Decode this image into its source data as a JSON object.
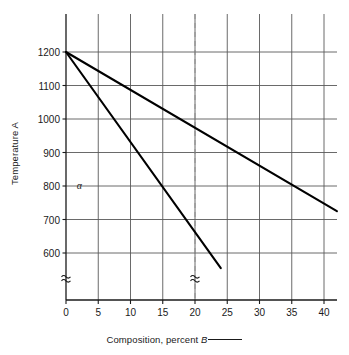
{
  "chart_data": {
    "type": "line",
    "title": "",
    "xlabel": "Composition, percent B",
    "ylabel": "Temperature A",
    "xlim": [
      0,
      42
    ],
    "ylim": [
      450,
      1300
    ],
    "grid": true,
    "legend": "none",
    "x_ticks": [
      "0",
      "5",
      "10",
      "15",
      "20",
      "25",
      "30",
      "35",
      "40"
    ],
    "x_tick_values": [
      0,
      5,
      10,
      15,
      20,
      25,
      30,
      35,
      40
    ],
    "y_ticks": [
      "1200",
      "1100",
      "1000",
      "900",
      "800",
      "700",
      "600"
    ],
    "y_tick_values": [
      1200,
      1100,
      1000,
      900,
      800,
      700,
      600
    ],
    "series": [
      {
        "name": "liquidus",
        "points": [
          [
            0,
            1200
          ],
          [
            42,
            725
          ]
        ]
      },
      {
        "name": "solidus",
        "points": [
          [
            0,
            1200
          ],
          [
            24,
            555
          ]
        ]
      }
    ],
    "annotations": [
      {
        "name": "alpha-phase-label",
        "text": "α",
        "x": 1.5,
        "y": 800
      },
      {
        "name": "composition-guideline",
        "text": "",
        "style": "dashed-vertical",
        "x": 20
      },
      {
        "name": "y-axis-break",
        "text": "≈",
        "x": 0,
        "y": 520
      },
      {
        "name": "guideline-break",
        "text": "≈",
        "x": 20,
        "y": 520
      }
    ]
  },
  "axes": {
    "y_title": "Temperature A",
    "x_title_main": "Composition, percent ",
    "x_title_italic": "B"
  },
  "colors": {
    "line": "#000000",
    "grid": "#595959",
    "axis": "#1a1a1a",
    "dashed": "#8c8c8c",
    "background": "#ffffff"
  }
}
